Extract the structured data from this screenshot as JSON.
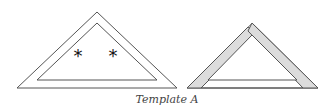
{
  "caption": "Template A",
  "figures": [
    {
      "name": "left-triangle",
      "outer": [
        [
          97,
          12
        ],
        [
          17,
          88
        ],
        [
          177,
          88
        ]
      ],
      "inner": [
        [
          97,
          23
        ],
        [
          37,
          80
        ],
        [
          157,
          80
        ]
      ],
      "band_fill": "#ffffff",
      "marks": [
        {
          "symbol": "*",
          "x": 78,
          "y": 55
        },
        {
          "symbol": "*",
          "x": 113,
          "y": 55
        }
      ]
    },
    {
      "name": "right-triangle",
      "outer": [
        [
          252,
          23
        ],
        [
          187,
          88
        ],
        [
          318,
          88
        ]
      ],
      "inner": [
        [
          252,
          35
        ],
        [
          208,
          80
        ],
        [
          297,
          80
        ]
      ],
      "side_fill": "#dcdcdc",
      "base_fill": "#ffffff"
    }
  ],
  "colors": {
    "stroke": "#555555",
    "shaded": "#dcdcdc"
  }
}
